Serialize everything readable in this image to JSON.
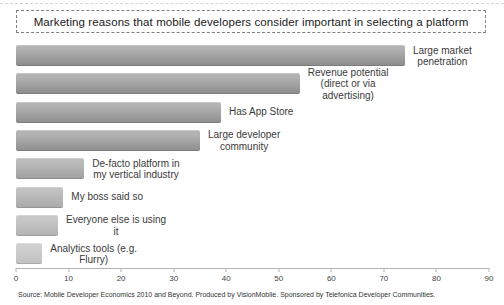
{
  "page": {
    "title": "Marketing reasons that mobile developers consider important in selecting a platform",
    "source": "Source: Mobile Developer Economics 2010 and Beyond. Produced by VisionMobile. Sponsored by Telefonica Developer Communities."
  },
  "chart_data": {
    "type": "bar",
    "orientation": "horizontal",
    "title": "Marketing reasons that mobile developers consider important in selecting a platform",
    "categories": [
      "Large market penetration",
      "Revenue potential (direct or via advertising)",
      "Has App Store",
      "Large developer community",
      "De-facto platform in my vertical industry",
      "My boss said so",
      "Everyone else is using it",
      "Analytics tools (e.g. Flurry)"
    ],
    "values": [
      74,
      54,
      39,
      35,
      13,
      9,
      8,
      5
    ],
    "bars": [
      {
        "name": "large-market-penetration",
        "label": "Large market\npenetration",
        "value": 74,
        "color_top": "#b2b2b2",
        "color_bottom": "#8c8c8c"
      },
      {
        "name": "revenue-potential",
        "label": "Revenue potential\n(direct or via\nadvertising)",
        "value": 54,
        "color_top": "#b2b2b2",
        "color_bottom": "#8c8c8c"
      },
      {
        "name": "has-app-store",
        "label": "Has App Store",
        "value": 39,
        "color_top": "#b3b3b3",
        "color_bottom": "#8e8e8e"
      },
      {
        "name": "large-developer-community",
        "label": "Large developer\ncommunity",
        "value": 35,
        "color_top": "#b3b3b3",
        "color_bottom": "#8e8e8e"
      },
      {
        "name": "de-facto-platform",
        "label": "De-facto platform in\nmy vertical industry",
        "value": 13,
        "color_top": "#bcbcbc",
        "color_bottom": "#a0a0a0"
      },
      {
        "name": "my-boss-said-so",
        "label": "My boss said so",
        "value": 9,
        "color_top": "#c2c2c2",
        "color_bottom": "#a9a9a9"
      },
      {
        "name": "everyone-else-is-using-it",
        "label": "Everyone else is using\nit",
        "value": 8,
        "color_top": "#c8c8c8",
        "color_bottom": "#b2b2b2"
      },
      {
        "name": "analytics-tools",
        "label": "Analytics tools (e.g.\nFlurry)",
        "value": 5,
        "color_top": "#d0d0d0",
        "color_bottom": "#c0c0c0"
      }
    ],
    "xlabel": "",
    "ylabel": "",
    "xlim": [
      0,
      90
    ],
    "x_ticks": [
      "0",
      "10",
      "20",
      "30",
      "40",
      "50",
      "60",
      "70",
      "80",
      "90"
    ],
    "grid": false,
    "legend": "none",
    "source": "Source: Mobile Developer Economics 2010 and Beyond. Produced by VisionMobile. Sponsored by Telefonica Developer Communities."
  }
}
